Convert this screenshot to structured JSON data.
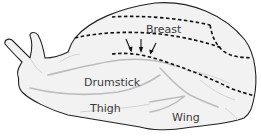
{
  "figure": {
    "labels": {
      "breast": "Breast",
      "drumstick": "Drumstick",
      "thigh": "Thigh",
      "wing": "Wing"
    },
    "annotations": {
      "arrow_count": 3,
      "dashed_cut_lines": 4
    },
    "colors": {
      "outline": "#222222",
      "fill": "#f2f2f2",
      "dashed_line": "#111111",
      "label_text": "#3a3a3a",
      "background": "#ffffff"
    }
  }
}
